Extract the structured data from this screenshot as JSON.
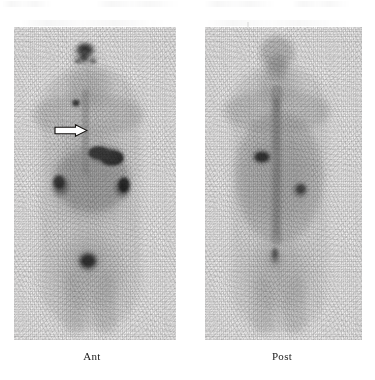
{
  "figure": {
    "kind": "nuclear-medicine-whole-body-scintigraphy",
    "background_color": "#ffffff",
    "width": 375,
    "height": 380
  },
  "panels": [
    {
      "id": "ant",
      "label": "Ant",
      "view_name": "Anterior",
      "frame": {
        "x": 14,
        "y": 27,
        "w": 162,
        "h": 313
      },
      "annotated": true
    },
    {
      "id": "post",
      "label": "Post",
      "view_name": "Posterior",
      "frame": {
        "x": 205,
        "y": 27,
        "w": 157,
        "h": 313
      },
      "annotated": false
    }
  ],
  "annotations": [
    {
      "type": "arrow",
      "name": "lesion-arrow",
      "direction": "right",
      "style": "white-filled-black-outline",
      "panel": "ant",
      "x": 40,
      "y": 97,
      "w": 34,
      "h": 13,
      "points_to": "midline-mediastinal-focus"
    }
  ],
  "uptake_foci": {
    "ant": [
      {
        "name": "thyroid-neck-uptake",
        "cx": 85,
        "cy": 50,
        "rx": 11,
        "ry": 9,
        "intensity": 0.95
      },
      {
        "name": "midline-focus-arrowed",
        "cx": 76,
        "cy": 103,
        "rx": 4,
        "ry": 4,
        "intensity": 0.62
      },
      {
        "name": "hepatic-intense-uptake",
        "cx": 106,
        "cy": 155,
        "rx": 17,
        "ry": 9,
        "intensity": 1.0
      },
      {
        "name": "right-flank-uptake",
        "cx": 61,
        "cy": 186,
        "rx": 12,
        "ry": 14,
        "intensity": 0.72
      },
      {
        "name": "left-flank-uptake",
        "cx": 122,
        "cy": 188,
        "rx": 11,
        "ry": 13,
        "intensity": 0.7
      },
      {
        "name": "bowel-background-uptake",
        "cx": 92,
        "cy": 180,
        "rx": 36,
        "ry": 30,
        "intensity": 0.38
      },
      {
        "name": "bladder-uptake",
        "cx": 88,
        "cy": 261,
        "rx": 13,
        "ry": 12,
        "intensity": 0.92
      }
    ],
    "post": [
      {
        "name": "head-neck-background",
        "cx": 78,
        "cy": 52,
        "rx": 16,
        "ry": 16,
        "intensity": 0.3
      },
      {
        "name": "focal-hotspot",
        "cx": 61,
        "cy": 157,
        "rx": 10,
        "ry": 8,
        "intensity": 0.98
      },
      {
        "name": "left-renal-uptake",
        "cx": 99,
        "cy": 190,
        "rx": 11,
        "ry": 11,
        "intensity": 0.48
      },
      {
        "name": "spine-midline-uptake",
        "cx": 72,
        "cy": 180,
        "rx": 12,
        "ry": 58,
        "intensity": 0.34
      },
      {
        "name": "torso-background",
        "cx": 76,
        "cy": 165,
        "rx": 48,
        "ry": 78,
        "intensity": 0.24
      },
      {
        "name": "sacral-midline-uptake",
        "cx": 72,
        "cy": 256,
        "rx": 8,
        "ry": 12,
        "intensity": 0.42
      }
    ]
  },
  "colors": {
    "background": "#ffffff",
    "panel_base": "#f2f2f2",
    "label_text": "#1b1b1b",
    "uptake_dark": "#0b0b0b",
    "arrow_fill": "#ffffff",
    "arrow_stroke": "#14120f"
  }
}
